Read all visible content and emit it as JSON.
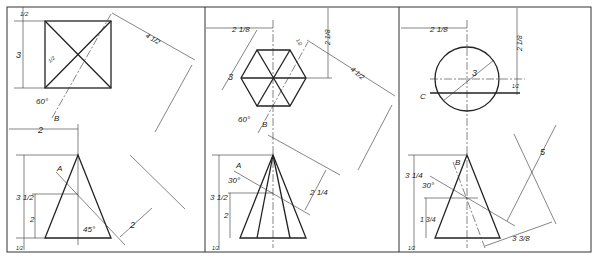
{
  "panels": [
    {
      "id": "left",
      "top_view": "square",
      "labels": {
        "top_offset": "1/2",
        "side": "3",
        "angle": "60°",
        "cut_line": "B",
        "small_dim": "1/2",
        "aux_dist": "4 1/2",
        "width": "2",
        "height": "3 1/2",
        "lower_height": "2",
        "bottom_offset": "1/2",
        "cut_plane": "A",
        "plane_angle": "45°",
        "aux_offset": "2"
      }
    },
    {
      "id": "middle",
      "top_view": "hexagon",
      "labels": {
        "width": "2 1/8",
        "top_offset": "2 1/8",
        "side": "3",
        "small_dim": "1/2",
        "aux_dist": "4 1/2",
        "angle": "60°",
        "cut_line": "B",
        "height": "3 1/2",
        "lower_height": "2",
        "bottom_offset": "1/2",
        "cut_plane": "A",
        "plane_angle": "30°",
        "aux_offset": "2 1/4"
      }
    },
    {
      "id": "right",
      "top_view": "circle",
      "labels": {
        "width": "2 1/8",
        "top_offset": "2 1/8",
        "diameter": "3",
        "section_line": "C",
        "small_dim": "1/2",
        "height": "3 1/4",
        "cut_line": "B",
        "cut_plane": "A",
        "plane_angle": "30°",
        "lower_height": "1 3/4",
        "bottom_offset": "1/2",
        "aux_dist": "5",
        "aux_offset": "3 3/8"
      }
    }
  ]
}
